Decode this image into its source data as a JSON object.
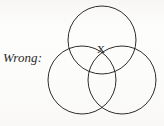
{
  "figure": {
    "caption_label": "Wrong:",
    "center_mark": "X",
    "stroke_color": "#2e2d2b",
    "text_color": "#2b2a28",
    "background_color": "#fdfdfc",
    "circles": [
      {
        "name": "top-circle",
        "cx": 102,
        "cy": 40,
        "r": 34
      },
      {
        "name": "bottom-left-circle",
        "cx": 82,
        "cy": 80,
        "r": 34
      },
      {
        "name": "bottom-right-circle",
        "cx": 122,
        "cy": 80,
        "r": 34
      }
    ],
    "center_mark_position": {
      "x": 101,
      "y": 53
    }
  }
}
